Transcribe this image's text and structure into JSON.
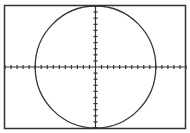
{
  "screen": {
    "frame_color": "#333333",
    "axis_color": "#333333",
    "curve_color": "#333333",
    "background": "#ffffff"
  },
  "chart_data": {
    "type": "line",
    "title": "",
    "xlabel": "",
    "ylabel": "",
    "equation": "x^2 + y^2 = 100",
    "center": [
      0,
      0
    ],
    "radius": 10,
    "xlim": [
      -15,
      15
    ],
    "ylim": [
      -10,
      10
    ],
    "xscale": 1,
    "yscale": 1,
    "grid": false,
    "legend": null
  }
}
